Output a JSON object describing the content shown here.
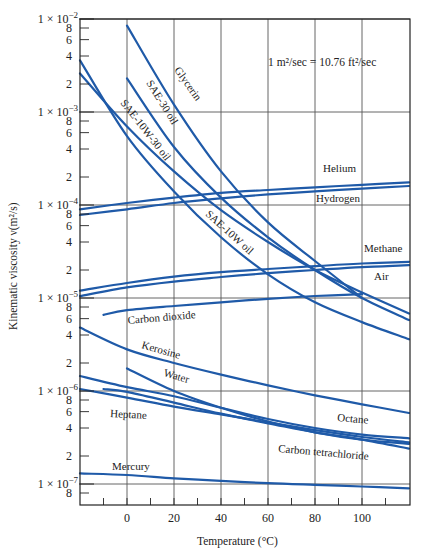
{
  "chart_data": {
    "type": "line",
    "title": "",
    "xlabel": "Temperature (°C)",
    "ylabel": "Kinematic viscosity ν(m²/s)",
    "xlim": [
      -20,
      120
    ],
    "ylim": [
      8e-08,
      0.01
    ],
    "yscale": "log",
    "grid": true,
    "annotation": "1 m²/sec = 10.76 ft²/sec",
    "x_ticks": [
      0,
      20,
      40,
      60,
      80,
      100
    ],
    "x_tick_labels": [
      "0",
      "20",
      "40",
      "60",
      "80",
      "100"
    ],
    "y_major_ticks": [
      {
        "value": 0.01,
        "label_base": "1 × 10",
        "label_exp": "−2"
      },
      {
        "value": 0.001,
        "label_base": "1 × 10",
        "label_exp": "−3"
      },
      {
        "value": 0.0001,
        "label_base": "1 × 10",
        "label_exp": "−4"
      },
      {
        "value": 1e-05,
        "label_base": "1 × 10",
        "label_exp": "−5"
      },
      {
        "value": 1e-06,
        "label_base": "1 × 10",
        "label_exp": "−6"
      },
      {
        "value": 1e-07,
        "label_base": "1 × 10",
        "label_exp": "−7"
      }
    ],
    "y_minor_labels": [
      "8",
      "6",
      "4",
      "2"
    ],
    "series": [
      {
        "name": "Glycerin",
        "x": [
          0,
          20,
          40,
          60,
          80,
          100
        ],
        "y": [
          0.0085,
          0.0012,
          0.00023,
          6.5e-05,
          2.5e-05,
          1e-05
        ]
      },
      {
        "name": "SAE-30 oil",
        "x": [
          0,
          20,
          40,
          60,
          80,
          100,
          120
        ],
        "y": [
          0.0023,
          0.00042,
          0.00012,
          4.5e-05,
          2e-05,
          1e-05,
          5.8e-06
        ]
      },
      {
        "name": "SAE-10W-30 oil",
        "x": [
          -20,
          0,
          20,
          40,
          60,
          80,
          100,
          120
        ],
        "y": [
          0.0026,
          0.0007,
          0.00023,
          8.8e-05,
          4e-05,
          2e-05,
          1.15e-05,
          6.8e-06
        ]
      },
      {
        "name": "SAE-10W oil",
        "x": [
          -20,
          0,
          20,
          40,
          60,
          80,
          100,
          120
        ],
        "y": [
          0.0036,
          0.00055,
          0.00014,
          4.5e-05,
          1.8e-05,
          9e-06,
          5.5e-06,
          3.6e-06
        ]
      },
      {
        "name": "Helium",
        "x": [
          -20,
          0,
          20,
          40,
          60,
          80,
          100,
          120
        ],
        "y": [
          9e-05,
          0.000105,
          0.00012,
          0.000135,
          0.000145,
          0.000155,
          0.000165,
          0.000175
        ]
      },
      {
        "name": "Hydrogen",
        "x": [
          -20,
          0,
          20,
          40,
          60,
          80,
          100,
          120
        ],
        "y": [
          7.8e-05,
          9e-05,
          0.000105,
          0.000118,
          0.00013,
          0.00014,
          0.00015,
          0.00016
        ]
      },
      {
        "name": "Methane",
        "x": [
          -20,
          0,
          20,
          40,
          60,
          80,
          100,
          120
        ],
        "y": [
          1.2e-05,
          1.45e-05,
          1.7e-05,
          1.9e-05,
          2.05e-05,
          2.2e-05,
          2.35e-05,
          2.45e-05
        ]
      },
      {
        "name": "Air",
        "x": [
          -20,
          0,
          20,
          40,
          60,
          80,
          100,
          120
        ],
        "y": [
          1.05e-05,
          1.3e-05,
          1.5e-05,
          1.68e-05,
          1.85e-05,
          2e-05,
          2.15e-05,
          2.25e-05
        ]
      },
      {
        "name": "Carbon dioxide",
        "x": [
          -10,
          0,
          20,
          40,
          60,
          80,
          100
        ],
        "y": [
          6.6e-06,
          7.4e-06,
          8.2e-06,
          9e-06,
          9.8e-06,
          1.05e-05,
          1.1e-05
        ]
      },
      {
        "name": "Kerosine",
        "x": [
          -20,
          0,
          20,
          40,
          60,
          80,
          100,
          120
        ],
        "y": [
          4.8e-06,
          2.8e-06,
          2e-06,
          1.5e-06,
          1.15e-06,
          9e-07,
          7.2e-07,
          5.8e-07
        ]
      },
      {
        "name": "Water",
        "x": [
          0,
          20,
          40,
          60,
          80,
          100,
          120
        ],
        "y": [
          1.75e-06,
          1e-06,
          6.6e-07,
          4.7e-07,
          3.6e-07,
          3e-07,
          2.7e-07
        ]
      },
      {
        "name": "Octane",
        "x": [
          -20,
          0,
          20,
          40,
          60,
          80,
          100,
          120
        ],
        "y": [
          1.45e-06,
          1.1e-06,
          8.8e-07,
          6.6e-07,
          5e-07,
          4e-07,
          3.4e-07,
          3.1e-07
        ]
      },
      {
        "name": "Heptane",
        "x": [
          -20,
          0,
          20,
          40,
          60,
          80,
          100,
          120
        ],
        "y": [
          1.05e-06,
          8.5e-07,
          6.8e-07,
          5.6e-07,
          4.6e-07,
          3.8e-07,
          3.2e-07,
          2.8e-07
        ]
      },
      {
        "name": "Carbon tetrachloride",
        "x": [
          -10,
          0,
          20,
          40,
          60,
          80,
          100,
          120
        ],
        "y": [
          1.05e-06,
          9.8e-07,
          7.5e-07,
          5.7e-07,
          4.5e-07,
          3.6e-07,
          3e-07,
          2.4e-07
        ]
      },
      {
        "name": "Mercury",
        "x": [
          -20,
          0,
          20,
          40,
          60,
          80,
          100,
          120
        ],
        "y": [
          1.3e-07,
          1.25e-07,
          1.15e-07,
          1.08e-07,
          1.02e-07,
          9.8e-08,
          9.4e-08,
          9e-08
        ]
      }
    ]
  },
  "labels": {
    "glycerin": "Glycerin",
    "sae30": "SAE-30 oil",
    "sae10w30": "SAE-10W-30 oil",
    "sae10w": "SAE-10W oil",
    "helium": "Helium",
    "hydrogen": "Hydrogen",
    "methane": "Methane",
    "air": "Air",
    "co2": "Carbon dioxide",
    "kerosine": "Kerosine",
    "water": "Water",
    "octane": "Octane",
    "heptane": "Heptane",
    "ccl4": "Carbon tetrachloride",
    "mercury": "Mercury"
  },
  "colors": {
    "curve": "#1f5aa8",
    "grid": "#555555",
    "axis": "#222222"
  }
}
